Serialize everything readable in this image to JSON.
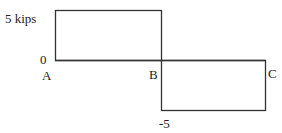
{
  "diagram": {
    "type": "shear-force diagram",
    "labels": {
      "top_value": "5 kips",
      "zero": "0",
      "bottom_value": "-5",
      "point_a": "A",
      "point_b": "B",
      "point_c": "C"
    },
    "segments": [
      {
        "from": "A",
        "to": "B",
        "value": 5
      },
      {
        "from": "B",
        "to": "C",
        "value": -5
      }
    ],
    "line_color": "#333333"
  }
}
